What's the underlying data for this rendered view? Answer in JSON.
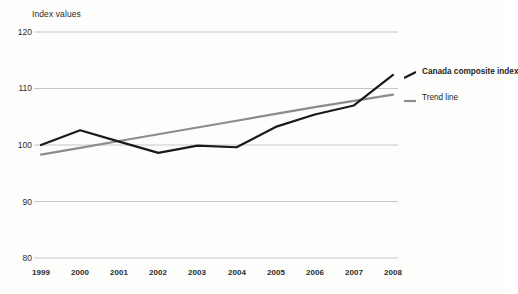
{
  "chart_data": {
    "type": "line",
    "title": "",
    "ylabel": "Index values",
    "xlabel": "",
    "x": [
      1999,
      2000,
      2001,
      2002,
      2003,
      2004,
      2005,
      2006,
      2007,
      2008
    ],
    "categories": [
      "1999",
      "2000",
      "2001",
      "2002",
      "2003",
      "2004",
      "2005",
      "2006",
      "2007",
      "2008"
    ],
    "ylim": [
      80,
      120
    ],
    "yticks": [
      80,
      90,
      100,
      110,
      120
    ],
    "ytick_labels": [
      "80",
      "90",
      "100",
      "110",
      "120"
    ],
    "grid": "horizontal",
    "legend_position": "right",
    "series": [
      {
        "name": "Canada composite index",
        "color": "#1a1a1a",
        "width": 2.2,
        "values": [
          100.0,
          102.6,
          100.6,
          98.6,
          99.9,
          99.6,
          103.2,
          105.4,
          107.0,
          112.4
        ]
      },
      {
        "name": "Trend line",
        "color": "#8c8c8c",
        "width": 2.2,
        "values": [
          98.3,
          99.5,
          100.7,
          101.9,
          103.1,
          104.3,
          105.5,
          106.7,
          107.8,
          108.9
        ]
      }
    ]
  },
  "legend": {
    "items": [
      {
        "label": "Canada composite index",
        "color": "#1a1a1a",
        "bold": true
      },
      {
        "label": "Trend line",
        "color": "#8c8c8c",
        "bold": false
      }
    ]
  },
  "axes": {
    "y_title": "Index values",
    "y_tick_0": "120",
    "y_tick_1": "110",
    "y_tick_2": "100",
    "y_tick_3": "90",
    "y_tick_4": "80",
    "x_tick_0": "1999",
    "x_tick_1": "2000",
    "x_tick_2": "2001",
    "x_tick_3": "2002",
    "x_tick_4": "2003",
    "x_tick_5": "2004",
    "x_tick_6": "2005",
    "x_tick_7": "2006",
    "x_tick_8": "2007",
    "x_tick_9": "2008"
  },
  "colors": {
    "grid": "#b8b8b8",
    "series_primary": "#1a1a1a",
    "series_trend": "#8c8c8c",
    "background": "#fdfdfc",
    "text": "#2b2b2b"
  }
}
